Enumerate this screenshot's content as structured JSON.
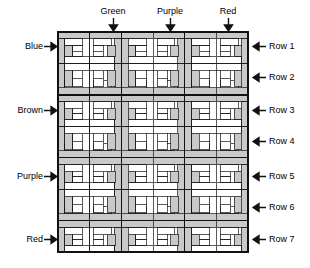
{
  "diagram": {
    "grid": {
      "columns": 6,
      "rows": 7,
      "cell_px": 32,
      "left_px": 57,
      "top_px": 31,
      "width_px": 192,
      "height_px": 222
    },
    "colors": {
      "shaded_fill": "#c9c9c9",
      "plain_fill": "#ffffff",
      "line": "#111111",
      "text": "#000000"
    }
  },
  "top_labels": [
    {
      "text": "Green",
      "x": 113,
      "arrow_x": 113
    },
    {
      "text": "Purple",
      "x": 170,
      "arrow_x": 170
    },
    {
      "text": "Red",
      "x": 228,
      "arrow_x": 228
    }
  ],
  "left_labels": [
    {
      "text": "Blue",
      "y": 46
    },
    {
      "text": "Brown",
      "y": 110
    },
    {
      "text": "Purple",
      "y": 176
    },
    {
      "text": "Red",
      "y": 239
    }
  ],
  "right_labels": [
    {
      "text": "Row 1",
      "y": 46
    },
    {
      "text": "Row 2",
      "y": 77
    },
    {
      "text": "Row 3",
      "y": 110
    },
    {
      "text": "Row 4",
      "y": 141
    },
    {
      "text": "Row 5",
      "y": 176
    },
    {
      "text": "Row 6",
      "y": 207
    },
    {
      "text": "Row 7",
      "y": 239
    }
  ],
  "icons": {
    "down_arrow": "arrow-down-icon",
    "right_arrow": "arrow-right-icon",
    "left_arrow": "arrow-left-icon"
  }
}
